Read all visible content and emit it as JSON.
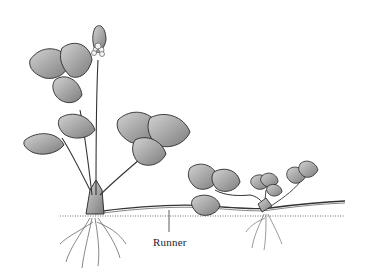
{
  "diagram": {
    "labels": [
      {
        "text": "Runner",
        "x": 153,
        "y": 236
      }
    ],
    "colors": {
      "background": "#ffffff",
      "ink": "#2a2a2a",
      "leaf_fill": "#9a9a9a",
      "leaf_light": "#c8c8c8",
      "soil": "#b0b0b0"
    }
  }
}
